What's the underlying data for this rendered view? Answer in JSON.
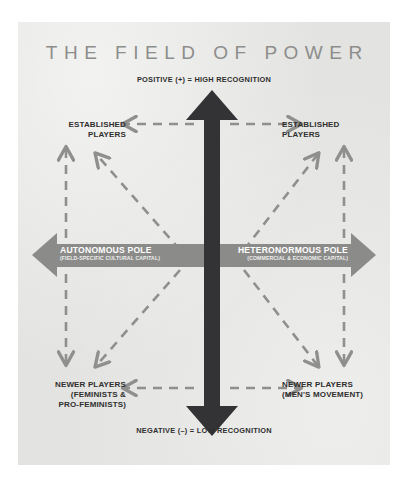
{
  "diagram": {
    "title": "THE FIELD OF POWER",
    "axes": {
      "top_caption": "POSITIVE (+) = HIGH RECOGNITION",
      "bottom_caption": "NEGATIVE (–) = LOW RECOGNITION",
      "left_pole": {
        "name": "AUTONOMOUS POLE",
        "sub": "(FIELD-SPECIFIC CULTURAL CAPITAL)"
      },
      "right_pole": {
        "name": "HETERONORMOUS POLE",
        "sub": "(COMMERCIAL & ECONOMIC CAPITAL)"
      }
    },
    "corners": {
      "top_left": {
        "name": "ESTABLISHED",
        "sub": "PLAYERS"
      },
      "top_right": {
        "name": "ESTABLISHED",
        "sub": "PLAYERS"
      },
      "bottom_left": {
        "name": "NEWER PLAYERS",
        "sub": "(FEMINISTS &",
        "sub2": "PRO-FEMINISTS)"
      },
      "bottom_right": {
        "name": "NEWER PLAYERS",
        "sub": "(MEN'S MOVEMENT)"
      }
    },
    "colors": {
      "panel_background": "#e3e3e1",
      "vertical_arrow": "#333335",
      "horizontal_arrow": "#8b8b89",
      "dashed_connector": "#8f8f8d",
      "title_text": "#8d8d8b",
      "body_text": "#2f2f2f",
      "pole_text": "#ffffff"
    }
  }
}
